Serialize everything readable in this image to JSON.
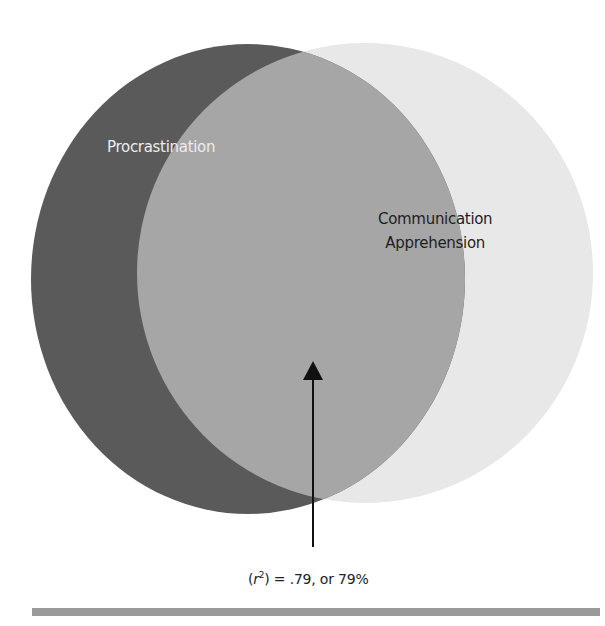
{
  "diagram": {
    "type": "venn",
    "circles": [
      {
        "name": "procrastination",
        "label": "Procrastination",
        "color": "#5a5a5a"
      },
      {
        "name": "communication-apprehension",
        "label_line1": "Communication",
        "label_line2": "Apprehension",
        "color": "#e8e8e8"
      }
    ],
    "overlap": {
      "color": "#a6a6a6"
    },
    "annotation": {
      "prefix": "(",
      "variable": "r",
      "exponent": "2",
      "suffix": ") = .79, or 79%"
    },
    "footer_bar_color": "#9a9a9a"
  }
}
